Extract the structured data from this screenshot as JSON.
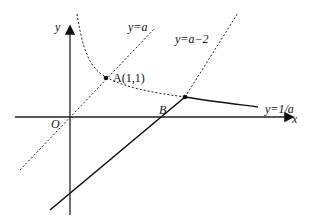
{
  "diagram": {
    "axes": {
      "x_label": "x",
      "y_label": "y",
      "origin_label": "O"
    },
    "lines": [
      {
        "id": "line-y-eq-a",
        "label": "y=a",
        "style": "dashed"
      },
      {
        "id": "line-y-eq-a-minus-2",
        "label": "y=a−2",
        "style": "dashed"
      },
      {
        "id": "curve-y-eq-1-over-a",
        "label": "y=1/a",
        "style": "dashed then solid"
      },
      {
        "id": "solid-segment",
        "label": "",
        "style": "solid"
      }
    ],
    "points": [
      {
        "id": "A",
        "label": "A(1,1)"
      },
      {
        "id": "B",
        "label": "B"
      }
    ]
  }
}
